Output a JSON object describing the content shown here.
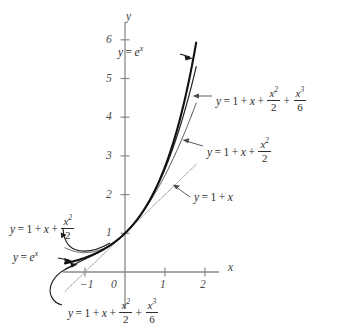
{
  "figure": {
    "background_color": "#ffffff",
    "width": 347,
    "height": 333
  },
  "axes": {
    "x_axis_label": "x",
    "y_axis_label": "y",
    "x_ticks": [
      {
        "value": -1,
        "label": "−1"
      },
      {
        "value": 0,
        "label": "0"
      },
      {
        "value": 1,
        "label": "1"
      },
      {
        "value": 2,
        "label": "2"
      }
    ],
    "y_ticks": [
      {
        "value": 1,
        "label": "1"
      },
      {
        "value": 2,
        "label": "2"
      },
      {
        "value": 3,
        "label": "3"
      },
      {
        "value": 4,
        "label": "4"
      },
      {
        "value": 5,
        "label": "5"
      },
      {
        "value": 6,
        "label": "6"
      }
    ],
    "origin_px": {
      "x": 125,
      "y": 272
    },
    "x_scale_px_per_unit": 40,
    "y_scale_px_per_unit": 38.7,
    "axis_color": "#8a8a8a"
  },
  "chart_data": {
    "type": "line",
    "title": "",
    "xlabel": "x",
    "ylabel": "y",
    "xlim": [
      -1.55,
      2.35
    ],
    "ylim": [
      -0.95,
      6.45
    ],
    "grid": false,
    "legend": "annotations",
    "series": [
      {
        "name": "y = e^x",
        "expression": "exp(x)",
        "style": "thick-solid",
        "color": "#111111",
        "x_range": [
          -1.5,
          1.78
        ]
      },
      {
        "name": "y = 1 + x + x^2/2 + x^3/6",
        "expression": "1 + x + x^2/2 + x^3/6",
        "style": "solid",
        "color": "#2a2a2a",
        "x_range": [
          -1.5,
          1.78
        ]
      },
      {
        "name": "y = 1 + x + x^2/2",
        "expression": "1 + x + x^2/2",
        "style": "solid",
        "color": "#4a4a4a",
        "x_range": [
          -1.5,
          1.78
        ]
      },
      {
        "name": "y = 1 + x",
        "expression": "1 + x",
        "style": "thin-solid",
        "color": "#9a9a9a",
        "x_range": [
          -1.5,
          1.78
        ]
      }
    ]
  },
  "annotations": {
    "exp_top": {
      "name": "y = e^x",
      "lhs": "y",
      "eq": "=",
      "base": "e",
      "exponent": "x"
    },
    "cubic_right": {
      "name": "y = 1 + x + x^2/2 + x^3/6",
      "lhs": "y",
      "eq": "=",
      "one": "1",
      "plus1": "+",
      "x": "x",
      "plus2": "+",
      "frac1_num": "x",
      "frac1_num_sup": "2",
      "frac1_den": "2",
      "plus3": "+",
      "frac2_num": "x",
      "frac2_num_sup": "3",
      "frac2_den": "6"
    },
    "quad_right": {
      "name": "y = 1 + x + x^2/2",
      "lhs": "y",
      "eq": "=",
      "one": "1",
      "plus1": "+",
      "x": "x",
      "plus2": "+",
      "frac_num": "x",
      "frac_num_sup": "2",
      "frac_den": "2"
    },
    "linear_right": {
      "name": "y = 1 + x",
      "lhs": "y",
      "eq": "=",
      "one": "1",
      "plus1": "+",
      "x": "x"
    },
    "quad_left": {
      "name": "y = 1 + x + x^2/2",
      "lhs": "y",
      "eq": "=",
      "one": "1",
      "plus1": "+",
      "x": "x",
      "plus2": "+",
      "frac_num": "x",
      "frac_num_sup": "2",
      "frac_den": "2"
    },
    "exp_left": {
      "name": "y = e^x",
      "lhs": "y",
      "eq": "=",
      "base": "e",
      "exponent": "x"
    },
    "cubic_bottom": {
      "name": "y = 1 + x + x^2/2 + x^3/6",
      "lhs": "y",
      "eq": "=",
      "one": "1",
      "plus1": "+",
      "x": "x",
      "plus2": "+",
      "frac1_num": "x",
      "frac1_num_sup": "2",
      "frac1_den": "2",
      "plus3": "+",
      "frac2_num": "x",
      "frac2_num_sup": "3",
      "frac2_den": "6"
    }
  }
}
